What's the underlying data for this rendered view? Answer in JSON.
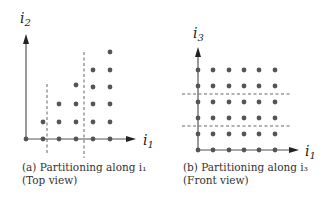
{
  "figure": {
    "panels": [
      {
        "id": "a",
        "caption_line1": "(a) Partitioning along i₁",
        "caption_line2": "(Top view)",
        "x_axis_label": "i",
        "x_axis_sub": "1",
        "y_axis_label": "i",
        "y_axis_sub": "2",
        "dot_counts_per_column": [
          1,
          2,
          3,
          4,
          5,
          6
        ],
        "partition_lines": "vertical",
        "partitions": 3
      },
      {
        "id": "b",
        "caption_line1": "(b) Partitioning along i₃",
        "caption_line2": "(Front view)",
        "x_axis_label": "i",
        "x_axis_sub": "1",
        "y_axis_label": "i",
        "y_axis_sub": "3",
        "grid": {
          "columns": 6,
          "rows": 6
        },
        "partition_lines": "horizontal",
        "partitions": 3
      }
    ],
    "colors": {
      "dot": "#555555",
      "axis": "#555555",
      "dash": "#555555"
    }
  }
}
